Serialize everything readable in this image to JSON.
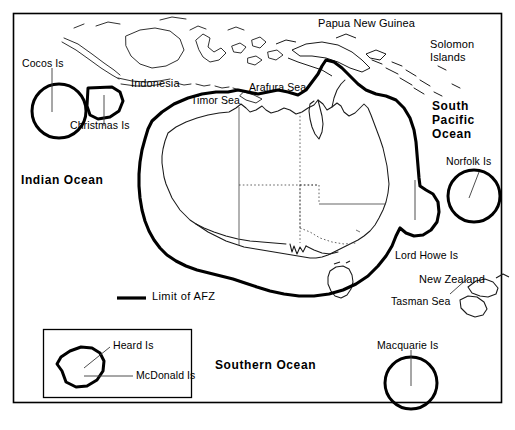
{
  "map": {
    "title": "Australian Fishing Zone (AFZ)",
    "frame": {
      "border_color": "#000000"
    },
    "colors": {
      "afz_limit": "#000000",
      "coastline": "#000000",
      "state_border": "#555555",
      "background": "#ffffff"
    },
    "legend": {
      "label": "Limit of AFZ",
      "symbol": "thick-line"
    },
    "oceans": [
      {
        "name": "indian-ocean",
        "label": "Indian Ocean"
      },
      {
        "name": "south-pacific-ocean",
        "label": "South\nPacific\nOcean",
        "lines": [
          "South",
          "Pacific",
          "Ocean"
        ]
      },
      {
        "name": "southern-ocean",
        "label": "Southern Ocean"
      }
    ],
    "seas": [
      {
        "name": "timor-sea",
        "label": "Timor Sea"
      },
      {
        "name": "arafura-sea",
        "label": "Arafura Sea"
      },
      {
        "name": "tasman-sea",
        "label": "Tasman Sea"
      }
    ],
    "countries": [
      {
        "name": "indonesia",
        "label": "Indonesia"
      },
      {
        "name": "papua-new-guinea",
        "label": "Papua New Guinea"
      },
      {
        "name": "solomon-islands",
        "label": "Solomon\nIslands",
        "lines": [
          "Solomon",
          "Islands"
        ]
      },
      {
        "name": "new-zealand",
        "label": "New Zealand"
      }
    ],
    "islands": [
      {
        "name": "cocos-is",
        "label": "Cocos Is"
      },
      {
        "name": "christmas-is",
        "label": "Christmas Is"
      },
      {
        "name": "norfolk-is",
        "label": "Norfolk Is"
      },
      {
        "name": "lord-howe-is",
        "label": "Lord Howe Is"
      },
      {
        "name": "macquarie-is",
        "label": "Macquarie Is"
      },
      {
        "name": "heard-is",
        "label": "Heard Is"
      },
      {
        "name": "mcdonald-is",
        "label": "McDonald Is"
      }
    ],
    "inset": {
      "name": "heard-mcdonald-inset",
      "labels": [
        "Heard Is",
        "McDonald Is"
      ]
    }
  },
  "labels": {
    "cocos_is": "Cocos Is",
    "christmas_is": "Christmas Is",
    "indonesia": "Indonesia",
    "papua_new_guinea": "Papua New Guinea",
    "solomon_line1": "Solomon",
    "solomon_line2": "Islands",
    "timor_sea": "Timor Sea",
    "arafura_sea": "Arafura Sea",
    "south_pacific_line1": "South",
    "south_pacific_line2": "Pacific",
    "south_pacific_line3": "Ocean",
    "norfolk_is": "Norfolk Is",
    "indian_ocean": "Indian Ocean",
    "lord_howe_is": "Lord Howe Is",
    "new_zealand": "New Zealand",
    "tasman_sea": "Tasman Sea",
    "macquarie_is": "Macquarie Is",
    "limit_of_afz": "Limit of AFZ",
    "southern_ocean": "Southern Ocean",
    "heard_is": "Heard Is",
    "mcdonald_is": "McDonald Is"
  }
}
